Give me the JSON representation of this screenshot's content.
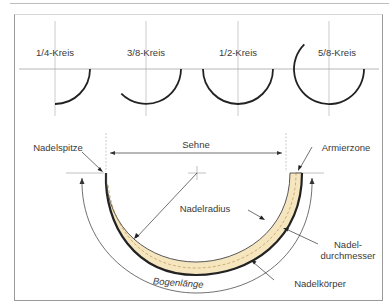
{
  "figure": {
    "curvature_types": [
      {
        "label": "1/4-Kreis",
        "fraction": 0.25
      },
      {
        "label": "3/8-Kreis",
        "fraction": 0.375
      },
      {
        "label": "1/2-Kreis",
        "fraction": 0.5
      },
      {
        "label": "5/8-Kreis",
        "fraction": 0.625
      }
    ],
    "needle_anatomy": {
      "labels": {
        "tip": "Nadelspitze",
        "chord": "Sehne",
        "swage": "Armierzone",
        "radius": "Nadelradius",
        "diameter_line1": "Nadel-",
        "diameter_line2": "durchmesser",
        "body": "Nadelkörper",
        "arc_length": "Bogenlänge"
      }
    },
    "colors": {
      "needle_fill": "#f6e6c0",
      "needle_outline": "#2a2a2a",
      "line": "#8a8a8a",
      "text": "#3a3a3a"
    }
  }
}
